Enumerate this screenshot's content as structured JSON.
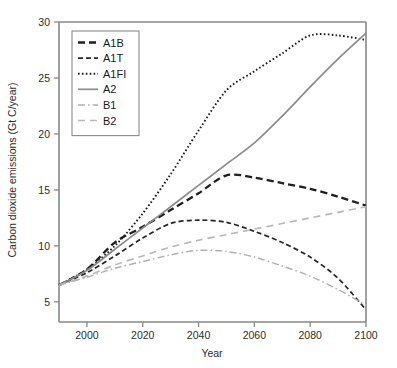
{
  "chart_data": {
    "type": "line",
    "title": "",
    "xlabel": "Year",
    "ylabel": "Carbon dioxide emissions (Gt C/year)",
    "xlim": [
      1990,
      2100
    ],
    "ylim": [
      3.2,
      30
    ],
    "grid": false,
    "legend_position": "top-left inside",
    "xticks": [
      2000,
      2020,
      2040,
      2060,
      2080,
      2100
    ],
    "xticklabels": [
      "2000",
      "2020",
      "2040",
      "2060",
      "2080",
      "2100"
    ],
    "yticks": [
      5,
      10,
      15,
      20,
      25,
      30
    ],
    "yticklabels": [
      "5",
      "10",
      "15",
      "20",
      "25",
      "30"
    ],
    "x": [
      1990,
      2000,
      2010,
      2020,
      2030,
      2040,
      2050,
      2060,
      2070,
      2080,
      2090,
      2100
    ],
    "series": [
      {
        "name": "A1B",
        "style": "dashed-thick",
        "color": "#1f1f1f",
        "values": [
          6.5,
          7.9,
          10.3,
          11.7,
          13.2,
          14.7,
          16.3,
          16.1,
          15.6,
          15.1,
          14.4,
          13.6
        ]
      },
      {
        "name": "A1T",
        "style": "dashed",
        "color": "#262626",
        "values": [
          6.5,
          7.6,
          9.1,
          10.7,
          12.0,
          12.3,
          12.1,
          11.3,
          10.3,
          9.0,
          7.1,
          4.3
        ]
      },
      {
        "name": "A1FI",
        "style": "dotted",
        "color": "#1a1a1a",
        "values": [
          6.5,
          7.9,
          10.0,
          12.9,
          16.4,
          20.3,
          23.9,
          25.6,
          27.2,
          28.8,
          28.8,
          28.4
        ]
      },
      {
        "name": "A2",
        "style": "solid",
        "color": "#8c8c8c",
        "values": [
          6.5,
          7.8,
          9.7,
          11.6,
          13.5,
          15.4,
          17.3,
          19.2,
          21.6,
          24.2,
          26.7,
          29.0
        ]
      },
      {
        "name": "B1",
        "style": "dash-dot",
        "color": "#b0b0b0",
        "values": [
          6.5,
          7.2,
          8.0,
          8.6,
          9.2,
          9.6,
          9.5,
          9.0,
          8.2,
          7.3,
          6.1,
          4.7
        ]
      },
      {
        "name": "B2",
        "style": "dashed-light",
        "color": "#b8b8b8",
        "values": [
          6.5,
          7.3,
          8.3,
          9.1,
          9.9,
          10.5,
          11.0,
          11.5,
          12.0,
          12.5,
          13.0,
          13.5
        ]
      }
    ],
    "legend_entries": [
      {
        "label": "A1B",
        "style": "dashed-thick",
        "color": "#1f1f1f"
      },
      {
        "label": "A1T",
        "style": "dashed",
        "color": "#262626"
      },
      {
        "label": "A1FI",
        "style": "dotted",
        "color": "#1a1a1a"
      },
      {
        "label": "A2",
        "style": "solid",
        "color": "#8c8c8c"
      },
      {
        "label": "B1",
        "style": "dash-dot",
        "color": "#b0b0b0"
      },
      {
        "label": "B2",
        "style": "dashed-light",
        "color": "#b8b8b8"
      }
    ]
  }
}
